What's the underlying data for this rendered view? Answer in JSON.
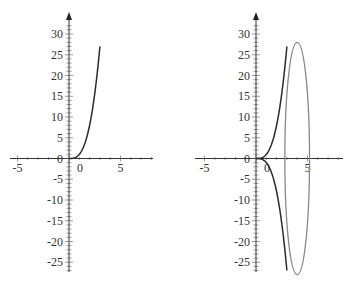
{
  "chart_data": [
    {
      "type": "line",
      "title": "",
      "xlabel": "",
      "ylabel": "",
      "xlim": [
        -5.7,
        8.2
      ],
      "ylim": [
        -27.5,
        34
      ],
      "grid": false,
      "legend": null,
      "x_ticks": [
        -5,
        0,
        5
      ],
      "x_tick_labels": [
        "-5",
        "0",
        "5"
      ],
      "y_ticks": [
        -25,
        -20,
        -15,
        -10,
        -5,
        0,
        5,
        10,
        15,
        20,
        25,
        30
      ],
      "y_tick_labels": [
        "-25",
        "-20",
        "-15",
        "-10",
        "-5",
        "0",
        "5",
        "10",
        "15",
        "20",
        "25",
        "30"
      ],
      "series": [
        {
          "name": "y = x^3",
          "color": "#2b2b2b",
          "x": [
            0,
            0.25,
            0.5,
            0.75,
            1.0,
            1.25,
            1.5,
            1.75,
            2.0,
            2.25,
            2.5,
            2.75,
            3.0
          ],
          "y": [
            0,
            0.016,
            0.125,
            0.42,
            1.0,
            1.95,
            3.375,
            5.36,
            8.0,
            11.39,
            15.63,
            20.8,
            27.0
          ]
        }
      ]
    },
    {
      "type": "line",
      "title": "",
      "xlabel": "",
      "ylabel": "",
      "xlim": [
        -5.9,
        8.5
      ],
      "ylim": [
        -27.5,
        34
      ],
      "grid": false,
      "legend": null,
      "x_ticks": [
        -5,
        0,
        5
      ],
      "x_tick_labels": [
        "-5",
        "0",
        "5"
      ],
      "y_ticks": [
        -25,
        -20,
        -15,
        -10,
        -5,
        0,
        5,
        10,
        15,
        20,
        25,
        30
      ],
      "y_tick_labels": [
        "-25",
        "-20",
        "-15",
        "-10",
        "-5",
        "0",
        "5",
        "10",
        "15",
        "20",
        "25",
        "30"
      ],
      "series": [
        {
          "name": "y = x^3",
          "color": "#2b2b2b",
          "x": [
            0,
            0.25,
            0.5,
            0.75,
            1.0,
            1.25,
            1.5,
            1.75,
            2.0,
            2.25,
            2.5,
            2.75,
            3.0
          ],
          "y": [
            0,
            0.016,
            0.125,
            0.42,
            1.0,
            1.95,
            3.375,
            5.36,
            8.0,
            11.39,
            15.63,
            20.8,
            27.0
          ]
        },
        {
          "name": "y = -x^3",
          "color": "#2b2b2b",
          "x": [
            0,
            0.25,
            0.5,
            0.75,
            1.0,
            1.25,
            1.5,
            1.75,
            2.0,
            2.25,
            2.5,
            2.75,
            3.0
          ],
          "y": [
            0,
            -0.016,
            -0.125,
            -0.42,
            -1.0,
            -1.95,
            -3.375,
            -5.36,
            -8.0,
            -11.39,
            -15.63,
            -20.8,
            -27.0
          ]
        },
        {
          "name": "ellipse",
          "color": "#888888",
          "shape": "ellipse",
          "center": [
            4.0,
            0
          ],
          "radius_x": 1.2,
          "radius_y": 28
        }
      ]
    }
  ]
}
